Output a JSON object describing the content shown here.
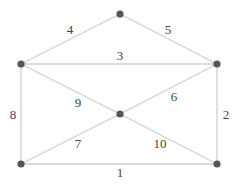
{
  "graph": {
    "colors": {
      "edge": "#cfcfcf",
      "node": "#555555",
      "label": "#444444"
    },
    "nodes": [
      {
        "id": "top",
        "x": 120,
        "y": 14
      },
      {
        "id": "left-upper",
        "x": 21,
        "y": 64
      },
      {
        "id": "right-upper",
        "x": 217,
        "y": 64
      },
      {
        "id": "center",
        "x": 120,
        "y": 114
      },
      {
        "id": "left-lower",
        "x": 21,
        "y": 164
      },
      {
        "id": "right-lower",
        "x": 217,
        "y": 164
      }
    ],
    "edges": [
      {
        "from": "left-lower",
        "to": "right-lower",
        "weight": "1",
        "lx": 120,
        "ly": 172
      },
      {
        "from": "right-upper",
        "to": "right-lower",
        "weight": "2",
        "lx": 226,
        "ly": 114
      },
      {
        "from": "left-upper",
        "to": "right-upper",
        "weight": "3",
        "lx": 120,
        "ly": 55
      },
      {
        "from": "left-upper",
        "to": "top",
        "weight": "4",
        "lx": 70,
        "ly": 29
      },
      {
        "from": "top",
        "to": "right-upper",
        "weight": "5",
        "lx": 168,
        "ly": 29
      },
      {
        "from": "center",
        "to": "right-upper",
        "weight": "6",
        "lx": 174,
        "ly": 96
      },
      {
        "from": "left-lower",
        "to": "center",
        "weight": "7",
        "lx": 78,
        "ly": 143
      },
      {
        "from": "left-upper",
        "to": "left-lower",
        "weight": "8",
        "lx": 13,
        "ly": 114
      },
      {
        "from": "left-upper",
        "to": "center",
        "weight": "9",
        "lx": 78,
        "ly": 102
      },
      {
        "from": "center",
        "to": "right-lower",
        "weight": "10",
        "lx": 160,
        "ly": 143
      }
    ]
  }
}
